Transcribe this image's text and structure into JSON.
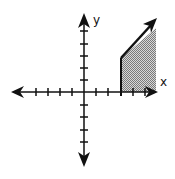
{
  "diagram": {
    "type": "coordinate-plane-inequality",
    "axes": {
      "x_label": "x",
      "y_label": "y",
      "x_ticks_left": 4,
      "x_ticks_right": 5,
      "y_ticks_up": 5,
      "y_ticks_down": 4
    },
    "shaded_region": {
      "description": "Region to the right of x = 3, above the x-axis, below a rising boundary line with an arrow",
      "left_boundary_x": 3,
      "fill_pattern": "stippled gray"
    },
    "colors": {
      "axis": "#111111",
      "shade": "#9a9a9a",
      "background": "#ffffff"
    }
  }
}
